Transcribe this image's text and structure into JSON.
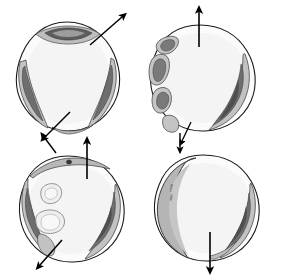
{
  "figure": {
    "background_color": "#ffffff",
    "width": 282,
    "height": 279,
    "caption": ""
  },
  "palette": {
    "outline": "#1a1a1a",
    "band_light": "#c9c9c9",
    "band_mid": "#a9a9a9",
    "core_dark": "#6e6e6e",
    "core_darker": "#4a4a4a",
    "interior_fill": "#fbfbfb",
    "interior_tint": "#f4f4f4",
    "arrow": "#000000",
    "label_text": "#2b2b2b"
  },
  "panels": [
    {
      "id": "panel-top-left",
      "position": "top-left",
      "index": 1,
      "outline_shape": "rounded-triangular-blob",
      "features": [
        {
          "name": "top-lens-dark",
          "description": "elongated dark lens shape across top center"
        },
        {
          "name": "left-edge-band",
          "description": "curved shaded band along left margin with dark core"
        },
        {
          "name": "right-edge-band",
          "description": "curved shaded band along right margin with dark core"
        },
        {
          "name": "bottom-edge-band",
          "description": "short shaded band at lower right margin"
        }
      ],
      "arrows": [
        {
          "name": "arrow-up-right",
          "direction": "up-right",
          "angle_deg": 45
        },
        {
          "name": "arrow-down-left",
          "direction": "down-left",
          "angle_deg": 225
        }
      ]
    },
    {
      "id": "panel-top-right",
      "position": "top-right",
      "index": 2,
      "outline_shape": "rounded-blob",
      "features": [
        {
          "name": "left-segment-chain",
          "description": "chain of four separate oval segments along left margin, each with a dark core"
        },
        {
          "name": "right-edge-crescent",
          "description": "long curved crescent band along right margin with dark core"
        },
        {
          "name": "bottom-left-tail",
          "description": "tapering band at lower left"
        }
      ],
      "arrows": [
        {
          "name": "arrow-up",
          "direction": "up",
          "angle_deg": 90
        },
        {
          "name": "arrow-down-left-small",
          "direction": "down-left",
          "angle_deg": 240
        }
      ]
    },
    {
      "id": "panel-bottom-left",
      "position": "bottom-left",
      "index": 3,
      "outline_shape": "rounded-blob",
      "features": [
        {
          "name": "top-rim-band",
          "description": "shaded band along upper left rim"
        },
        {
          "name": "left-edge-band",
          "description": "curved shaded band along left margin with dark core"
        },
        {
          "name": "right-edge-band",
          "description": "curved shaded band along right margin with dark core"
        },
        {
          "name": "interior-blob-upper",
          "description": "free-floating irregular blob inside upper interior"
        },
        {
          "name": "interior-blob-lower",
          "description": "free-floating irregular blob inside mid interior"
        },
        {
          "name": "rim-dot",
          "description": "small dark dot on the upper rim"
        }
      ],
      "arrows": [
        {
          "name": "arrow-up",
          "direction": "up",
          "angle_deg": 90
        },
        {
          "name": "arrow-down-left",
          "direction": "down-left",
          "angle_deg": 230
        },
        {
          "name": "arrow-up-left-top",
          "direction": "up-left",
          "angle_deg": 125
        }
      ]
    },
    {
      "id": "panel-bottom-right",
      "position": "bottom-right",
      "index": 4,
      "outline_shape": "rounded-blob",
      "features": [
        {
          "name": "left-wide-crescent",
          "description": "wide solid gray crescent band along entire left margin"
        },
        {
          "name": "right-edge-band",
          "description": "curved shaded band along right margin with dark core"
        },
        {
          "name": "bottom-right-band",
          "description": "shaded band along lower right margin"
        }
      ],
      "labels": [
        {
          "name": "band-label-upper",
          "text": "whole",
          "x": 171,
          "y": 190,
          "rotation": -78
        },
        {
          "name": "band-label-lower",
          "text": "layer",
          "x": 171,
          "y": 199,
          "rotation": -78
        }
      ],
      "arrows": [
        {
          "name": "arrow-down",
          "direction": "down",
          "angle_deg": 270
        },
        {
          "name": "arrow-down-top",
          "direction": "down",
          "angle_deg": 270
        }
      ]
    }
  ]
}
